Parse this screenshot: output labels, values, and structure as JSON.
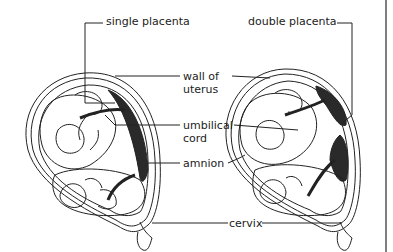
{
  "diagram": {
    "panels": [
      {
        "id": "left",
        "label": "single placenta"
      },
      {
        "id": "right",
        "label": "double placenta"
      }
    ],
    "labels": {
      "single_placenta": "single placenta",
      "double_placenta": "double placenta",
      "wall_of_uterus_line1": "wall of",
      "wall_of_uterus_line2": "uterus",
      "umbilical_cord_line1": "umbilical",
      "umbilical_cord_line2": "cord",
      "amnion": "amnion",
      "cervix": "cervix"
    },
    "colors": {
      "line": "#222222",
      "placenta_fill": "#2a2a2a",
      "background": "#ffffff"
    }
  }
}
